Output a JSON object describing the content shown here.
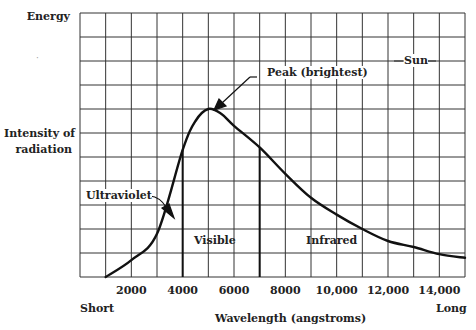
{
  "chart_data": {
    "type": "line",
    "title": "",
    "xlabel": "Wavelength (angstroms)",
    "ylabel": "Intensity of radiation",
    "y_top_label": "Energy",
    "x_left_label": "Short",
    "x_right_label": "Long",
    "xlim": [
      0,
      15000
    ],
    "ylim": [
      0,
      11
    ],
    "grid": true,
    "x_ticks": [
      2000,
      4000,
      6000,
      8000,
      10000,
      12000,
      14000
    ],
    "x_tick_labels": [
      "2000",
      "4000",
      "6000",
      "8000",
      "10,000",
      "12,000",
      "14,000"
    ],
    "series": [
      {
        "name": "Sun",
        "x": [
          1000,
          2000,
          3000,
          4000,
          4500,
          5000,
          5500,
          6000,
          7000,
          8000,
          9000,
          10000,
          11000,
          12000,
          13000,
          14000,
          15000
        ],
        "values": [
          0,
          0.7,
          1.8,
          5.3,
          6.5,
          7.0,
          6.8,
          6.3,
          5.4,
          4.3,
          3.3,
          2.6,
          2.0,
          1.5,
          1.25,
          0.95,
          0.8
        ]
      }
    ],
    "regions": [
      {
        "name": "Ultraviolet",
        "x_range": [
          1000,
          4000
        ]
      },
      {
        "name": "Visible",
        "x_range": [
          4000,
          7000
        ]
      },
      {
        "name": "Infrared",
        "x_range": [
          7000,
          15000
        ]
      }
    ],
    "annotations": [
      {
        "text": "Peak (brightest)",
        "x": 5000,
        "y": 7.0
      },
      {
        "text": "Sun",
        "x": 13000,
        "y": 9.0
      },
      {
        "text": "Ultraviolet",
        "x": 3500,
        "y": 2.6
      },
      {
        "text": "Visible",
        "x": 5000,
        "y": 1.5
      },
      {
        "text": "Infrared",
        "x": 8500,
        "y": 1.5
      }
    ]
  },
  "labels": {
    "energy": "Energy",
    "intensity_line1": "Intensity of",
    "intensity_line2": "radiation",
    "short": "Short",
    "long": "Long",
    "xlabel": "Wavelength (angstroms)",
    "peak": "Peak (brightest)",
    "sun": "Sun",
    "ultraviolet": "Ultraviolet",
    "visible": "Visible",
    "infrared": "Infrared"
  },
  "ticks": [
    "2000",
    "4000",
    "6000",
    "8000",
    "10,000",
    "12,000",
    "14,000"
  ]
}
